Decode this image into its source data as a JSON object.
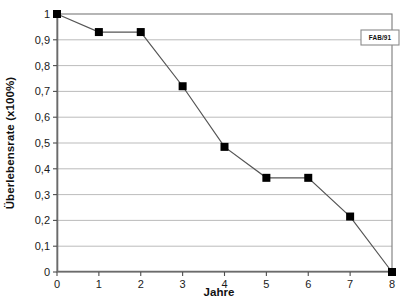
{
  "chart_data": {
    "type": "line",
    "title": "",
    "xlabel": "Jahre",
    "ylabel": "Überlebensrate (x100%)",
    "x": [
      0,
      1,
      2,
      3,
      4,
      5,
      6,
      7,
      8
    ],
    "xtick_labels": [
      "0",
      "1",
      "2",
      "3",
      "4",
      "5",
      "6",
      "7",
      "8"
    ],
    "xlim": [
      0,
      8
    ],
    "ylim": [
      0,
      1
    ],
    "ytick_labels": [
      "0",
      "0,1",
      "0,2",
      "0,3",
      "0,4",
      "0,5",
      "0,6",
      "0,7",
      "0,8",
      "0,9",
      "1"
    ],
    "ytick_values": [
      0,
      0.1,
      0.2,
      0.3,
      0.4,
      0.5,
      0.6,
      0.7,
      0.8,
      0.9,
      1
    ],
    "grid": "horizontal",
    "legend_position": "top-right",
    "series": [
      {
        "name": "FAB/91",
        "marker": "square",
        "marker_color": "#000000",
        "line_color": "#555555",
        "values": [
          1.0,
          0.93,
          0.93,
          0.72,
          0.485,
          0.365,
          0.365,
          0.215,
          0.0
        ]
      }
    ],
    "annotations": []
  },
  "legend": {
    "label": "FAB/91"
  },
  "axes": {
    "x_title": "Jahre",
    "y_title": "Überlebensrate (x100%)"
  }
}
